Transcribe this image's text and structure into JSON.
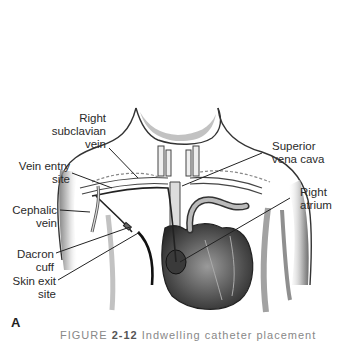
{
  "figure": {
    "panel_letter": "A",
    "caption_prefix": "FIGURE",
    "caption_number": "2-12",
    "caption_rest": "Indwelling catheter placement"
  },
  "labels": {
    "right_subclavian_vein": [
      "Right",
      "subclavian",
      "vein"
    ],
    "vein_entry_site": [
      "Vein entry",
      "site"
    ],
    "cephalic_vein": [
      "Cephalic",
      "vein"
    ],
    "dacron_cuff": [
      "Dacron",
      "cuff"
    ],
    "skin_exit_site": [
      "Skin exit",
      "site"
    ],
    "superior_vena_cava": [
      "Superior",
      "vena cava"
    ],
    "right_atrium": [
      "Right",
      "atrium"
    ]
  },
  "colors": {
    "ink": "#2a2a2a",
    "shade": "#8a8a8a",
    "heart": "#5a5a5a",
    "background": "#ffffff"
  }
}
